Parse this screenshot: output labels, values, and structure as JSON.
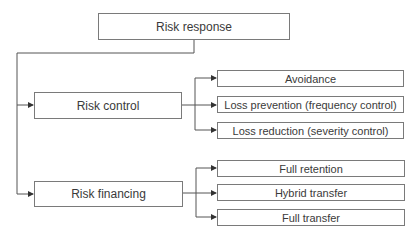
{
  "diagram": {
    "root": {
      "label": "Risk response"
    },
    "branches": [
      {
        "label": "Risk control",
        "children": [
          {
            "label": "Avoidance"
          },
          {
            "label": "Loss prevention (frequency control)"
          },
          {
            "label": "Loss reduction (severity control)"
          }
        ]
      },
      {
        "label": "Risk financing",
        "children": [
          {
            "label": "Full retention"
          },
          {
            "label": "Hybrid transfer"
          },
          {
            "label": "Full transfer"
          }
        ]
      }
    ],
    "colors": {
      "line": "#555555",
      "border": "#7a7a7a",
      "text": "#3a3a3a"
    }
  }
}
